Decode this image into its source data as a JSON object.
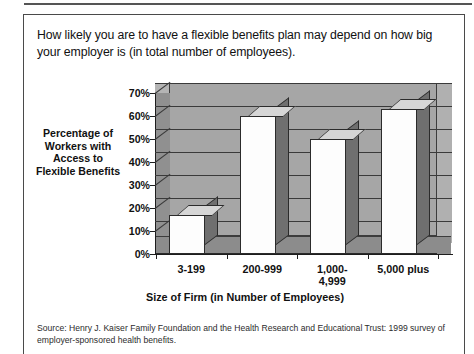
{
  "headline": "How likely you are to have a flexible benefits plan may depend on how big your employer is (in total number of employees).",
  "source_note": "Source:  Henry J. Kaiser Family Foundation and the Health Research and Educational Trust: 1999 survey of employer-sponsored health benefits.",
  "colors": {
    "plot_background": "#a6a6a6",
    "bar_face": "#fdfdfd",
    "bar_side": "#6f6f6f",
    "bar_top": "#d6d6d6",
    "gridline": "#3a3a3a",
    "text": "#111111",
    "border": "#4a4a4a"
  },
  "chart_data": {
    "type": "bar",
    "title": "",
    "categories": [
      "3-199",
      "200-999",
      "1,000-\n4,999",
      "5,000 plus"
    ],
    "values": [
      17,
      60,
      50,
      63
    ],
    "series": [
      {
        "name": "Percentage of Workers with Access to Flexible Benefits",
        "values": [
          17,
          60,
          50,
          63
        ]
      }
    ],
    "xlabel": "Size of Firm (in Number of Employees)",
    "ylabel": "Percentage of Workers with Access to Flexible Benefits",
    "ylim": [
      0,
      70
    ],
    "ytick_values": [
      0,
      10,
      20,
      30,
      40,
      50,
      60,
      70
    ],
    "ytick_labels": [
      "0%",
      "10%",
      "20%",
      "30%",
      "40%",
      "50%",
      "60%",
      "70%"
    ],
    "grid": true,
    "legend": false,
    "three_d": true
  }
}
